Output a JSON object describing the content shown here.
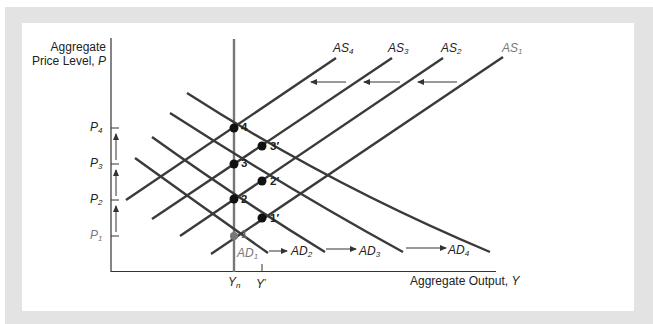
{
  "figure": {
    "y_axis_title_line1": "Aggregate",
    "y_axis_title_line2": "Price Level, ",
    "y_axis_var": "P",
    "x_axis_title": "Aggregate Output, ",
    "x_axis_var": "Y",
    "x_ticks": [
      {
        "base": "Y",
        "sub": "n"
      },
      {
        "base": "Y",
        "sub": "′"
      }
    ],
    "y_ticks": [
      {
        "base": "P",
        "sub": "4"
      },
      {
        "base": "P",
        "sub": "3"
      },
      {
        "base": "P",
        "sub": "2"
      },
      {
        "base": "P",
        "sub": "1"
      }
    ],
    "as_curves": [
      {
        "base": "AS",
        "sub": "4"
      },
      {
        "base": "AS",
        "sub": "3"
      },
      {
        "base": "AS",
        "sub": "2"
      },
      {
        "base": "AS",
        "sub": "1"
      }
    ],
    "ad_curves": [
      {
        "base": "AD",
        "sub": "1"
      },
      {
        "base": "AD",
        "sub": "2"
      },
      {
        "base": "AD",
        "sub": "3"
      },
      {
        "base": "AD",
        "sub": "4"
      }
    ],
    "points": [
      "1",
      "2",
      "3",
      "4",
      "1′",
      "2′",
      "3′"
    ],
    "colors": {
      "frame": "#e3e3e3",
      "curve": "#3a3a3a",
      "light_curve": "#777777",
      "axis": "#333333"
    }
  }
}
